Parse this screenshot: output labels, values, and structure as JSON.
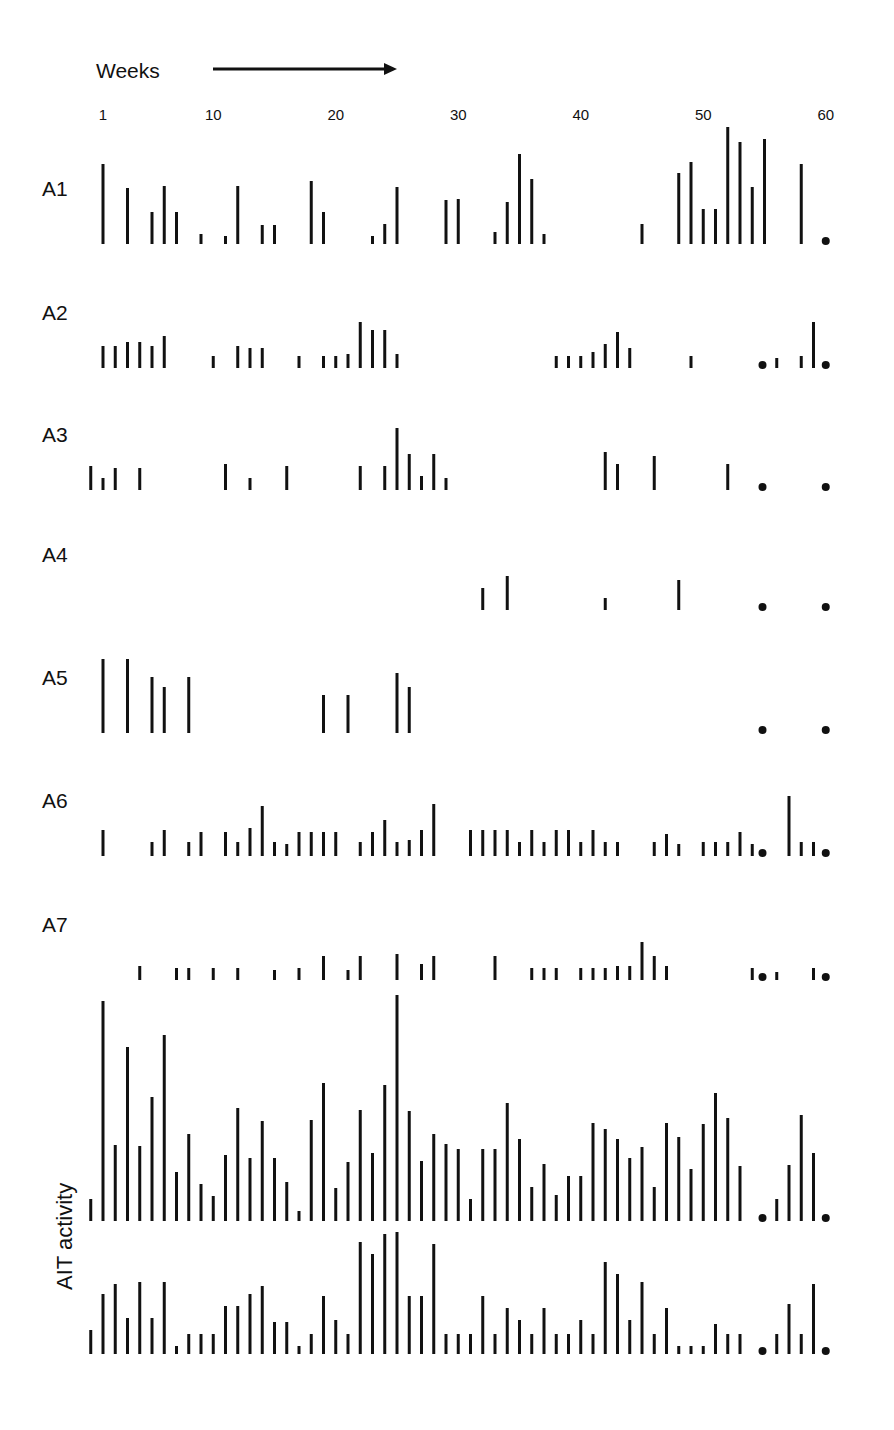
{
  "header": {
    "weeks_label": "Weeks"
  },
  "y_axis_label": "AIT activity",
  "axis": {
    "ticks": [
      1,
      10,
      20,
      30,
      40,
      50,
      60
    ],
    "x_start_px": 103,
    "px_per_week": 12.25
  },
  "colors": {
    "ink": "#111111",
    "background": "#ffffff"
  },
  "rows": [
    {
      "label": "A1",
      "baseline": 244,
      "label_y": 196
    },
    {
      "label": "A2",
      "baseline": 368,
      "label_y": 320
    },
    {
      "label": "A3",
      "baseline": 490,
      "label_y": 442
    },
    {
      "label": "A4",
      "baseline": 610,
      "label_y": 562
    },
    {
      "label": "A5",
      "baseline": 733,
      "label_y": 685
    },
    {
      "label": "A6",
      "baseline": 856,
      "label_y": 808
    },
    {
      "label": "A7",
      "baseline": 980,
      "label_y": 932
    },
    {
      "label": "",
      "baseline": 1221,
      "label_y": 0
    },
    {
      "label": "",
      "baseline": 1354,
      "label_y": 0
    }
  ],
  "chart_data": {
    "type": "bar",
    "title": "",
    "xlabel": "Weeks",
    "ylabel": "AIT activity",
    "x_ticks": [
      1,
      10,
      20,
      30,
      40,
      50,
      60
    ],
    "xlim": [
      1,
      60
    ],
    "grid": false,
    "legend": null,
    "note": "Each row is an event-raster style bar plot; bar heights in pixels above baseline; a dot marks end-of-series weeks",
    "series": [
      {
        "name": "A1",
        "bars": [
          [
            1,
            80
          ],
          [
            3,
            56
          ],
          [
            5,
            32
          ],
          [
            6,
            58
          ],
          [
            7,
            32
          ],
          [
            9,
            10
          ],
          [
            11,
            8
          ],
          [
            12,
            58
          ],
          [
            14,
            19
          ],
          [
            15,
            19
          ],
          [
            18,
            63
          ],
          [
            19,
            32
          ],
          [
            23,
            8
          ],
          [
            24,
            20
          ],
          [
            25,
            57
          ],
          [
            29,
            44
          ],
          [
            30,
            45
          ],
          [
            33,
            12
          ],
          [
            34,
            42
          ],
          [
            35,
            90
          ],
          [
            36,
            65
          ],
          [
            37,
            10
          ],
          [
            45,
            20
          ],
          [
            48,
            71
          ],
          [
            49,
            82
          ],
          [
            50,
            35
          ],
          [
            51,
            35
          ],
          [
            52,
            117
          ],
          [
            53,
            102
          ],
          [
            54,
            57
          ],
          [
            55,
            105
          ],
          [
            58,
            80
          ]
        ],
        "dots": [
          60
        ]
      },
      {
        "name": "A2",
        "bars": [
          [
            1,
            22
          ],
          [
            2,
            22
          ],
          [
            3,
            26
          ],
          [
            4,
            26
          ],
          [
            5,
            22
          ],
          [
            6,
            32
          ],
          [
            10,
            12
          ],
          [
            12,
            22
          ],
          [
            13,
            20
          ],
          [
            14,
            20
          ],
          [
            17,
            12
          ],
          [
            19,
            12
          ],
          [
            20,
            12
          ],
          [
            21,
            14
          ],
          [
            22,
            46
          ],
          [
            23,
            38
          ],
          [
            24,
            38
          ],
          [
            25,
            14
          ],
          [
            38,
            12
          ],
          [
            39,
            12
          ],
          [
            40,
            12
          ],
          [
            41,
            16
          ],
          [
            42,
            24
          ],
          [
            43,
            36
          ],
          [
            44,
            20
          ],
          [
            49,
            12
          ],
          [
            56,
            10
          ],
          [
            58,
            12
          ],
          [
            59,
            46
          ]
        ],
        "dots": [
          55,
          60
        ]
      },
      {
        "name": "A3",
        "bars": [
          [
            0,
            24
          ],
          [
            1,
            12
          ],
          [
            2,
            22
          ],
          [
            4,
            22
          ],
          [
            11,
            26
          ],
          [
            13,
            12
          ],
          [
            16,
            24
          ],
          [
            22,
            24
          ],
          [
            24,
            24
          ],
          [
            25,
            62
          ],
          [
            26,
            36
          ],
          [
            27,
            14
          ],
          [
            28,
            36
          ],
          [
            29,
            12
          ],
          [
            42,
            38
          ],
          [
            43,
            26
          ],
          [
            46,
            34
          ],
          [
            52,
            26
          ]
        ],
        "dots": [
          55,
          60
        ]
      },
      {
        "name": "A4",
        "bars": [
          [
            32,
            22
          ],
          [
            34,
            34
          ],
          [
            42,
            12
          ],
          [
            48,
            30
          ]
        ],
        "dots": [
          55,
          60
        ]
      },
      {
        "name": "A5",
        "bars": [
          [
            1,
            74
          ],
          [
            3,
            74
          ],
          [
            5,
            56
          ],
          [
            6,
            46
          ],
          [
            8,
            56
          ],
          [
            19,
            38
          ],
          [
            21,
            38
          ],
          [
            25,
            60
          ],
          [
            26,
            46
          ]
        ],
        "dots": [
          55,
          60
        ]
      },
      {
        "name": "A6",
        "bars": [
          [
            1,
            26
          ],
          [
            5,
            14
          ],
          [
            6,
            26
          ],
          [
            8,
            14
          ],
          [
            9,
            24
          ],
          [
            11,
            24
          ],
          [
            12,
            14
          ],
          [
            13,
            28
          ],
          [
            14,
            50
          ],
          [
            15,
            14
          ],
          [
            16,
            12
          ],
          [
            17,
            24
          ],
          [
            18,
            24
          ],
          [
            19,
            24
          ],
          [
            20,
            24
          ],
          [
            22,
            14
          ],
          [
            23,
            24
          ],
          [
            24,
            36
          ],
          [
            25,
            14
          ],
          [
            26,
            16
          ],
          [
            27,
            26
          ],
          [
            28,
            52
          ],
          [
            31,
            26
          ],
          [
            32,
            26
          ],
          [
            33,
            26
          ],
          [
            34,
            26
          ],
          [
            35,
            14
          ],
          [
            36,
            26
          ],
          [
            37,
            14
          ],
          [
            38,
            26
          ],
          [
            39,
            26
          ],
          [
            40,
            14
          ],
          [
            41,
            26
          ],
          [
            42,
            14
          ],
          [
            43,
            14
          ],
          [
            46,
            14
          ],
          [
            47,
            22
          ],
          [
            48,
            12
          ],
          [
            50,
            14
          ],
          [
            51,
            14
          ],
          [
            52,
            14
          ],
          [
            53,
            24
          ],
          [
            54,
            12
          ],
          [
            57,
            60
          ],
          [
            58,
            14
          ],
          [
            59,
            14
          ]
        ],
        "dots": [
          55,
          60
        ]
      },
      {
        "name": "A7",
        "bars": [
          [
            4,
            14
          ],
          [
            7,
            12
          ],
          [
            8,
            12
          ],
          [
            10,
            12
          ],
          [
            12,
            12
          ],
          [
            15,
            10
          ],
          [
            17,
            12
          ],
          [
            19,
            24
          ],
          [
            21,
            10
          ],
          [
            22,
            24
          ],
          [
            25,
            26
          ],
          [
            27,
            16
          ],
          [
            28,
            24
          ],
          [
            33,
            24
          ],
          [
            36,
            12
          ],
          [
            37,
            12
          ],
          [
            38,
            12
          ],
          [
            40,
            12
          ],
          [
            41,
            12
          ],
          [
            42,
            12
          ],
          [
            43,
            14
          ],
          [
            44,
            14
          ],
          [
            45,
            38
          ],
          [
            46,
            24
          ],
          [
            47,
            14
          ],
          [
            54,
            12
          ],
          [
            56,
            8
          ],
          [
            59,
            12
          ]
        ],
        "dots": [
          55,
          60
        ]
      },
      {
        "name": "AIT activity (upper)",
        "bars": [
          [
            0,
            22
          ],
          [
            1,
            220
          ],
          [
            2,
            76
          ],
          [
            3,
            174
          ],
          [
            4,
            75
          ],
          [
            5,
            124
          ],
          [
            6,
            186
          ],
          [
            7,
            49
          ],
          [
            8,
            87
          ],
          [
            9,
            37
          ],
          [
            10,
            25
          ],
          [
            11,
            66
          ],
          [
            12,
            113
          ],
          [
            13,
            63
          ],
          [
            14,
            100
          ],
          [
            15,
            63
          ],
          [
            16,
            39
          ],
          [
            17,
            10
          ],
          [
            18,
            101
          ],
          [
            19,
            138
          ],
          [
            20,
            33
          ],
          [
            21,
            59
          ],
          [
            22,
            111
          ],
          [
            23,
            68
          ],
          [
            24,
            136
          ],
          [
            25,
            226
          ],
          [
            26,
            110
          ],
          [
            27,
            60
          ],
          [
            28,
            87
          ],
          [
            29,
            77
          ],
          [
            30,
            72
          ],
          [
            31,
            22
          ],
          [
            32,
            72
          ],
          [
            33,
            72
          ],
          [
            34,
            118
          ],
          [
            35,
            82
          ],
          [
            36,
            34
          ],
          [
            37,
            57
          ],
          [
            38,
            26
          ],
          [
            39,
            45
          ],
          [
            40,
            45
          ],
          [
            41,
            98
          ],
          [
            42,
            92
          ],
          [
            43,
            82
          ],
          [
            44,
            63
          ],
          [
            45,
            74
          ],
          [
            46,
            34
          ],
          [
            47,
            98
          ],
          [
            48,
            84
          ],
          [
            49,
            52
          ],
          [
            50,
            97
          ],
          [
            51,
            128
          ],
          [
            52,
            103
          ],
          [
            53,
            55
          ],
          [
            56,
            22
          ],
          [
            57,
            56
          ],
          [
            58,
            106
          ],
          [
            59,
            68
          ]
        ],
        "dots": [
          55,
          60
        ]
      },
      {
        "name": "AIT activity (lower)",
        "bars": [
          [
            0,
            24
          ],
          [
            1,
            60
          ],
          [
            2,
            70
          ],
          [
            3,
            36
          ],
          [
            4,
            72
          ],
          [
            5,
            36
          ],
          [
            6,
            72
          ],
          [
            7,
            8
          ],
          [
            8,
            20
          ],
          [
            9,
            20
          ],
          [
            10,
            20
          ],
          [
            11,
            48
          ],
          [
            12,
            48
          ],
          [
            13,
            60
          ],
          [
            14,
            68
          ],
          [
            15,
            32
          ],
          [
            16,
            32
          ],
          [
            17,
            8
          ],
          [
            18,
            20
          ],
          [
            19,
            58
          ],
          [
            20,
            34
          ],
          [
            21,
            20
          ],
          [
            22,
            112
          ],
          [
            23,
            100
          ],
          [
            24,
            120
          ],
          [
            25,
            122
          ],
          [
            26,
            58
          ],
          [
            27,
            58
          ],
          [
            28,
            110
          ],
          [
            29,
            20
          ],
          [
            30,
            20
          ],
          [
            31,
            20
          ],
          [
            32,
            58
          ],
          [
            33,
            20
          ],
          [
            34,
            46
          ],
          [
            35,
            34
          ],
          [
            36,
            20
          ],
          [
            37,
            46
          ],
          [
            38,
            20
          ],
          [
            39,
            20
          ],
          [
            40,
            34
          ],
          [
            41,
            20
          ],
          [
            42,
            92
          ],
          [
            43,
            80
          ],
          [
            44,
            34
          ],
          [
            45,
            72
          ],
          [
            46,
            20
          ],
          [
            47,
            46
          ],
          [
            48,
            8
          ],
          [
            49,
            8
          ],
          [
            50,
            8
          ],
          [
            51,
            30
          ],
          [
            52,
            20
          ],
          [
            53,
            20
          ],
          [
            56,
            20
          ],
          [
            57,
            50
          ],
          [
            58,
            20
          ],
          [
            59,
            70
          ]
        ],
        "dots": [
          55,
          60
        ]
      }
    ]
  }
}
